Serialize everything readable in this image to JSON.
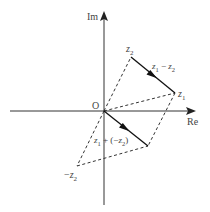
{
  "diagram": {
    "title": "",
    "type": "complex-plane vector subtraction",
    "axes": {
      "x_label": "Re",
      "y_label": "Im",
      "origin_label": "O"
    },
    "points": {
      "z1": {
        "label_main": "z",
        "label_sub": "1"
      },
      "z2": {
        "label_main": "z",
        "label_sub": "2"
      },
      "neg_z2": {
        "label_prefix": "−",
        "label_main": "z",
        "label_sub": "2"
      }
    },
    "vectors": {
      "difference": {
        "label_a": "z",
        "sub_a": "1",
        "op": " − ",
        "label_b": "z",
        "sub_b": "2"
      },
      "sum_with_negative": {
        "label_a": "z",
        "sub_a": "1",
        "op": " + (−",
        "label_b": "z",
        "sub_b": "2",
        "close": ")"
      }
    },
    "colors": {
      "axis": "#333333",
      "vector": "#111111",
      "dashed": "#333333",
      "text": "#444444"
    }
  }
}
